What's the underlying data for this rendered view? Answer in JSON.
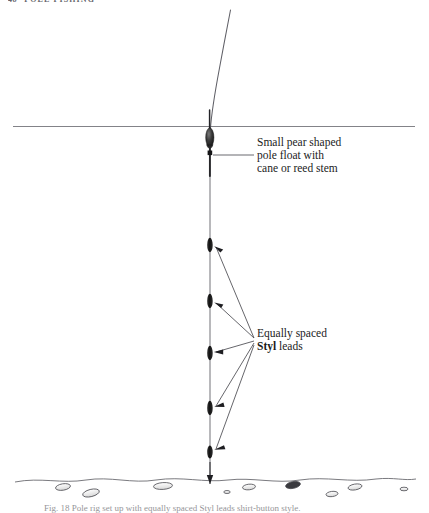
{
  "page": {
    "width": 429,
    "height": 511,
    "background": "#ffffff",
    "ink": "#1b1b1b"
  },
  "running_head": {
    "folio": "48",
    "title": "POLE FISHING"
  },
  "figure": {
    "name": "pole-float-rig-diagram",
    "waterline": {
      "label": "water-surface-line",
      "y": 126,
      "x_start": 13,
      "x_end": 415
    },
    "main_line": {
      "label": "pole-rig-line",
      "x": 210,
      "y_top": 10,
      "y_bottom": 479
    },
    "float": {
      "name": "pear-shaped-pole-float",
      "body_center_y": 137,
      "body_top_y": 128,
      "body_bottom_y": 147,
      "antenna_label": "float-antenna",
      "stem_label": "cane-or-reed-stem"
    },
    "styl_leads": {
      "name": "styl-lead-shot",
      "count": 5,
      "positions_y": [
        245,
        301,
        353,
        408,
        452
      ],
      "spacing_note": "Equally spaced"
    },
    "riverbed": {
      "label": "river-bed-line",
      "y": 478,
      "pebble_count": 9
    },
    "hook": {
      "label": "hook-at-bed",
      "y": 479
    }
  },
  "annotations": [
    {
      "name": "annotation-float",
      "lines": [
        "Small pear shaped",
        "pole float with",
        "cane or reed stem"
      ],
      "leader": "horizontal",
      "leader_y": 155,
      "leader_x_start": 213,
      "leader_x_end": 254
    },
    {
      "name": "annotation-styl-leads",
      "lines": [
        "Equally spaced",
        "Styl leads"
      ],
      "bold_word": "Styl",
      "leader": "fan-arrows",
      "fan_origin_x": 256,
      "fan_origin_y": 340
    }
  ],
  "caption": {
    "text": "Fig. 18  Pole rig set up with equally spaced Styl leads shirt-button style."
  }
}
